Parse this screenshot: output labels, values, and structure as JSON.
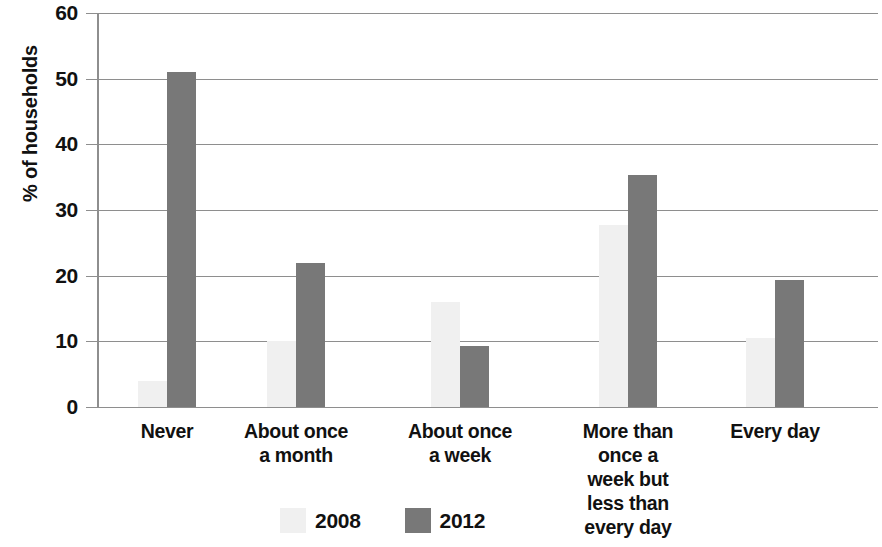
{
  "chart_data": {
    "type": "bar",
    "title": "",
    "subtitle": "",
    "xlabel": "",
    "ylabel": "% of households",
    "ylim": [
      0,
      60
    ],
    "yticks": [
      0,
      10,
      20,
      30,
      40,
      50,
      60
    ],
    "ytick_labels": [
      "0",
      "10",
      "20",
      "30",
      "40",
      "50",
      "60"
    ],
    "grid": true,
    "legend_position": "bottom",
    "categories": [
      "Never",
      "About once\na month",
      "About once\na week",
      "More than\nonce a\nweek but\nless than\nevery day",
      "Every day"
    ],
    "series": [
      {
        "name": "2008",
        "color": "#f0f0f0",
        "values": [
          4,
          10,
          16,
          27.7,
          10.5
        ]
      },
      {
        "name": "2012",
        "color": "#787878",
        "values": [
          51,
          22,
          9.3,
          35.4,
          19.3
        ]
      }
    ]
  },
  "legend": {
    "items": [
      {
        "label": "2008",
        "swatch": "legend-swatch-2008"
      },
      {
        "label": "2012",
        "swatch": "legend-swatch-2012"
      }
    ]
  },
  "colors": {
    "series_2008": "#f0f0f0",
    "series_2012": "#787878",
    "gridline": "#8e8e8e",
    "text": "#111111",
    "background": "#ffffff"
  }
}
